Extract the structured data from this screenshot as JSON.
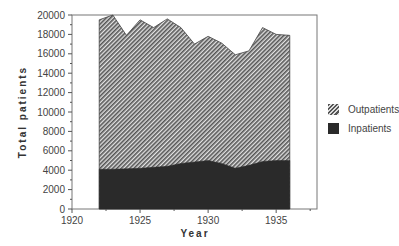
{
  "chart_data": {
    "type": "area",
    "stacked": true,
    "title": "",
    "xlabel": "Year",
    "ylabel": "Total patients",
    "xlim": [
      1920,
      1938
    ],
    "ylim": [
      0,
      20000
    ],
    "x_ticks": [
      1920,
      1925,
      1930,
      1935
    ],
    "y_ticks": [
      0,
      2000,
      4000,
      6000,
      8000,
      10000,
      12000,
      14000,
      16000,
      18000,
      20000
    ],
    "x": [
      1922,
      1923,
      1924,
      1925,
      1926,
      1927,
      1928,
      1929,
      1930,
      1931,
      1932,
      1933,
      1934,
      1935,
      1936
    ],
    "series": [
      {
        "name": "Inpatients",
        "pattern": "solid",
        "color": "#2a2a2a",
        "values": [
          4100,
          4100,
          4150,
          4200,
          4300,
          4400,
          4700,
          4850,
          5000,
          4700,
          4200,
          4500,
          4900,
          5000,
          5000
        ]
      },
      {
        "name": "Outpatients",
        "pattern": "hatched",
        "color": "#888888",
        "values": [
          15400,
          15900,
          13750,
          15300,
          14400,
          15200,
          14000,
          12150,
          12800,
          12400,
          11700,
          11800,
          13800,
          13000,
          12900
        ]
      }
    ],
    "totals": [
      19500,
      20000,
      17900,
      19500,
      18700,
      19600,
      18700,
      17000,
      17800,
      17100,
      15900,
      16300,
      18700,
      18000,
      17900
    ],
    "legend_position": "right",
    "grid": false
  },
  "legend": {
    "items": [
      {
        "label": "Outpatients"
      },
      {
        "label": "Inpatients"
      }
    ]
  }
}
